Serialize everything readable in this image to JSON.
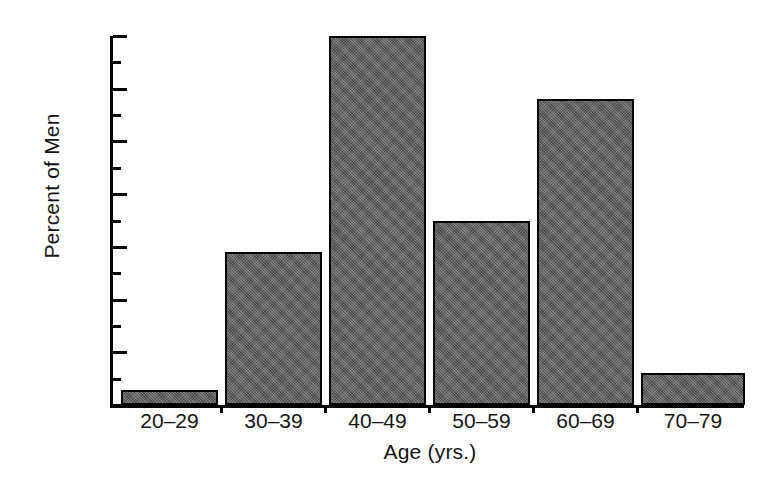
{
  "chart_data": {
    "type": "bar",
    "title": "",
    "xlabel": "Age (yrs.)",
    "ylabel": "Percent of Men",
    "categories": [
      "20–29",
      "30–39",
      "40–49",
      "50–59",
      "60–69",
      "70–79"
    ],
    "values": [
      1.4,
      14.5,
      35,
      17.5,
      29,
      3
    ],
    "ylim": [
      0,
      35
    ],
    "xlim_note": "categorical, contiguous bars with thin white separators",
    "yticks_major": [
      0,
      5,
      10,
      15,
      20,
      25,
      30,
      35
    ],
    "yticks_major_labels": [
      "0",
      "5",
      "10",
      "15",
      "20",
      "25",
      "30",
      "35"
    ],
    "yticks_minor": [
      2.5,
      7.5,
      12.5,
      17.5,
      22.5,
      27.5,
      32.5
    ],
    "grid": false,
    "legend": null,
    "bar_color": "#5c5c5c",
    "bar_edge_color": "#000000",
    "axis_color": "#000000",
    "background_color": "#ffffff"
  },
  "axes": {
    "y_title": "Percent of Men",
    "x_title": "Age (yrs.)"
  }
}
